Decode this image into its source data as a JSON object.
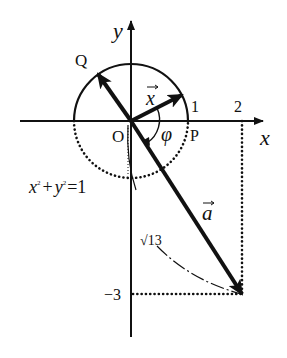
{
  "diagram": {
    "type": "coordinate-plane vector diagram",
    "axes": {
      "x_label": "x",
      "y_label": "y",
      "origin_label": "O",
      "x_ticks": [
        "1",
        "2"
      ],
      "y_ticks": [
        "−3"
      ]
    },
    "points": {
      "P": "P",
      "Q": "Q"
    },
    "vectors": {
      "x_vec": "x",
      "a_vec": "a"
    },
    "angle_label": "φ",
    "circle_equation": {
      "x": "x",
      "sup1": "2",
      "plus": "+",
      "y": "y",
      "sup2": "2",
      "eq": "=1"
    },
    "length_label": "√13",
    "colors": {
      "ink": "#111111",
      "background": "#ffffff"
    }
  }
}
